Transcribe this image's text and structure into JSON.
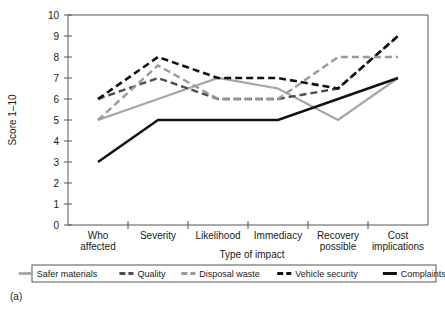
{
  "panel": {
    "label": "(a)"
  },
  "chart_data": {
    "type": "line",
    "title": "",
    "xlabel": "Type of impact",
    "ylabel": "Score 1–10",
    "categories": [
      "Who affected",
      "Severity",
      "Likelihood",
      "Immediacy",
      "Recovery possible",
      "Cost implications"
    ],
    "category_lines": [
      [
        "Who",
        "affected"
      ],
      [
        "Severity",
        ""
      ],
      [
        "Likelihood",
        ""
      ],
      [
        "Immediacy",
        ""
      ],
      [
        "Recovery",
        "possible"
      ],
      [
        "Cost",
        "implications"
      ]
    ],
    "ylim": [
      0,
      10
    ],
    "yticks": [
      0,
      1,
      2,
      3,
      4,
      5,
      6,
      7,
      8,
      9,
      10
    ],
    "ytick_labels": [
      "0",
      "1",
      "2",
      "3",
      "4",
      "5",
      "6",
      "7",
      "8",
      "9",
      "10"
    ],
    "grid": false,
    "legend_position": "below",
    "series": [
      {
        "name": "Safer materials",
        "values": [
          5,
          6,
          7,
          6.5,
          5,
          7
        ],
        "color": "#a6a6a6",
        "style": "solid",
        "width": 2.2,
        "dash": "none"
      },
      {
        "name": "Quality",
        "values": [
          6,
          7,
          6,
          6,
          6.5,
          9
        ],
        "color": "#4d4d4d",
        "style": "dashed",
        "width": 2.4,
        "dash": "7,4"
      },
      {
        "name": "Disposal waste",
        "values": [
          5,
          7.6,
          6,
          6,
          8,
          8
        ],
        "color": "#999999",
        "style": "dashed",
        "width": 2.4,
        "dash": "7,4"
      },
      {
        "name": "Vehicle security",
        "values": [
          6,
          8,
          7,
          7,
          6.5,
          9
        ],
        "color": "#111111",
        "style": "dashed",
        "width": 2.6,
        "dash": "7,4"
      },
      {
        "name": "Complaints",
        "values": [
          3,
          5,
          5,
          5,
          6,
          7
        ],
        "color": "#111111",
        "style": "solid",
        "width": 2.4,
        "dash": "none"
      }
    ]
  },
  "legend": {
    "items": [
      {
        "label": "Safer materials"
      },
      {
        "label": "Quality"
      },
      {
        "label": "Disposal waste"
      },
      {
        "label": "Vehicle security"
      },
      {
        "label": "Complaints"
      }
    ]
  }
}
